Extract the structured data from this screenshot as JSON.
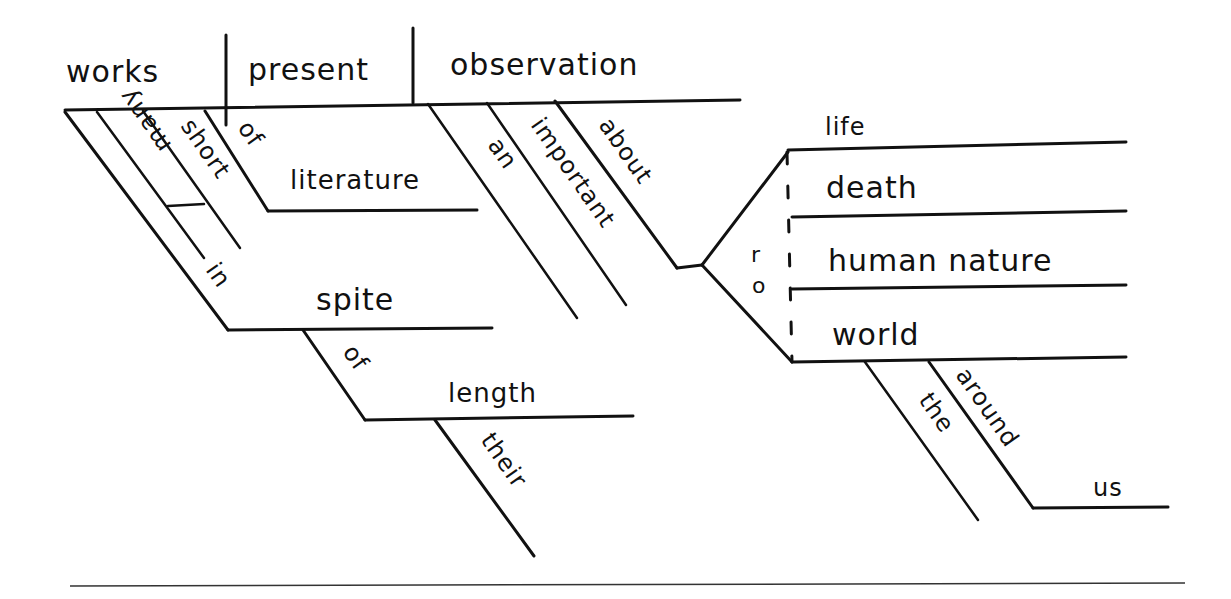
{
  "diagram": {
    "type": "reed-kellogg-sentence-diagram",
    "main_line": {
      "subject": "works",
      "verb": "present",
      "direct_object": "observation"
    },
    "subject_modifiers": [
      "many",
      "short",
      "of",
      "literature"
    ],
    "in_spite_phrase": {
      "preposition": "in",
      "object": "spite",
      "sub_preposition": "of",
      "sub_object": "length",
      "sub_object_modifier": "their"
    },
    "object_modifiers": [
      "an",
      "important",
      "about"
    ],
    "compound_objects": [
      "life",
      "death",
      "human nature",
      "world"
    ],
    "conjunction": "or",
    "world_modifiers": {
      "article": "the",
      "preposition": "around",
      "object": "us"
    }
  }
}
